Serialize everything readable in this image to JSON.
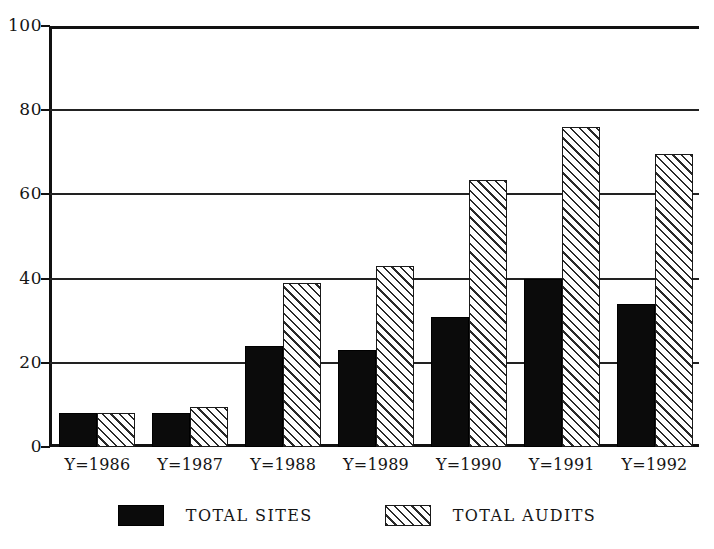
{
  "chart_data": {
    "type": "bar",
    "title": "",
    "subtitle": "",
    "xlabel": "",
    "ylabel": "",
    "ylim": [
      0,
      100
    ],
    "yticks": [
      0,
      20,
      40,
      60,
      80,
      100
    ],
    "ytick_labels": [
      "0",
      "20",
      "40",
      "60",
      "80",
      "100"
    ],
    "grid": true,
    "gridlines_at": [
      20,
      40,
      60,
      80
    ],
    "legend_position": "bottom-center",
    "orientation": "vertical",
    "grouping": "grouped",
    "categories": [
      "Y=1986",
      "Y=1987",
      "Y=1988",
      "Y=1989",
      "Y=1990",
      "Y=1991",
      "Y=1992"
    ],
    "series": [
      {
        "name": "TOTAL SITES",
        "fill": "solid-black",
        "color": "#0b0b0b",
        "values": [
          8,
          8,
          24,
          23,
          31,
          40,
          34
        ]
      },
      {
        "name": "TOTAL AUDITS",
        "fill": "diagonal-hatch",
        "color": "#ffffff",
        "values": [
          8,
          9.5,
          39,
          43,
          63.5,
          76,
          69.5
        ]
      }
    ]
  },
  "legend": {
    "items": [
      {
        "label": "TOTAL SITES",
        "swatch": "solid-black-swatch"
      },
      {
        "label": "TOTAL AUDITS",
        "swatch": "hatched-swatch"
      }
    ]
  },
  "colors": {
    "axis": "#111111",
    "gridline": "#222222",
    "bar_sites": "#0b0b0b",
    "bar_audits_outline": "#1a1a1a",
    "background": "#ffffff"
  }
}
